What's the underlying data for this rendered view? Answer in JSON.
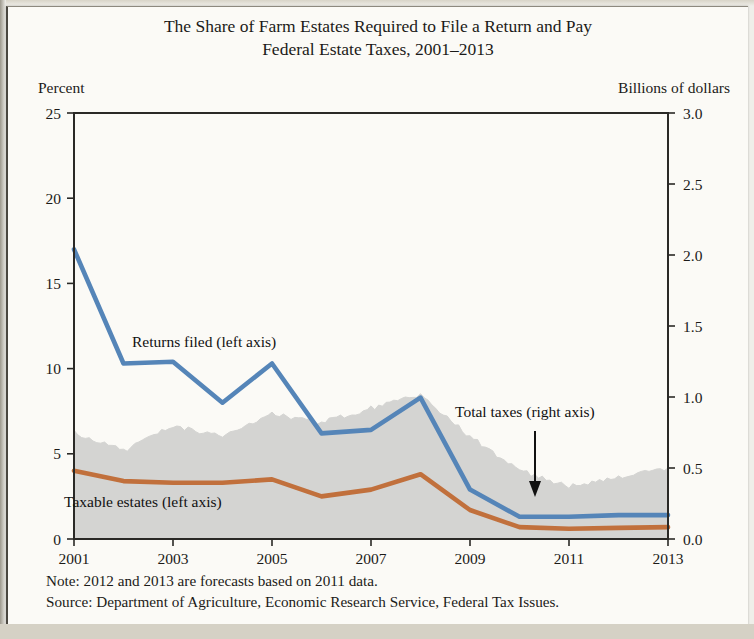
{
  "title": {
    "line1": "The Share of Farm Estates Required to File a Return and Pay",
    "line2": "Federal Estate Taxes, 2001–2013"
  },
  "axis_labels": {
    "left": "Percent",
    "right": "Billions of dollars"
  },
  "annotations": {
    "returns_filed": "Returns filed (left axis)",
    "taxable_estates": "Taxable estates (left axis)",
    "total_taxes": "Total taxes (right axis)"
  },
  "footnotes": {
    "note": "Note: 2012 and 2013 are forecasts based on 2011 data.",
    "source": "Source: Department of Agriculture, Economic Research Service, Federal Tax Issues."
  },
  "colors": {
    "returns_filed": "#5585b8",
    "taxable_estates": "#c1703c",
    "total_taxes_area": "#d4d4d2",
    "axis": "#2a2926",
    "text": "#1b1a18",
    "paper": "#fbfaf6"
  },
  "chart_data": {
    "type": "line",
    "title": "The Share of Farm Estates Required to File a Return and Pay Federal Estate Taxes, 2001–2013",
    "xlabel": "",
    "ylabel": "Percent",
    "y2label": "Billions of dollars",
    "grid": false,
    "legend": "inline-annotations",
    "x": [
      2001,
      2002,
      2003,
      2004,
      2005,
      2006,
      2007,
      2008,
      2009,
      2010,
      2011,
      2012,
      2013
    ],
    "xtick_labels": [
      "2001",
      "2003",
      "2005",
      "2007",
      "2009",
      "2011",
      "2013"
    ],
    "xtick_values": [
      2001,
      2003,
      2005,
      2007,
      2009,
      2011,
      2013
    ],
    "ylim": [
      0,
      25
    ],
    "ytick_labels": [
      "0",
      "5",
      "10",
      "15",
      "20",
      "25"
    ],
    "ytick_values": [
      0,
      5,
      10,
      15,
      20,
      25
    ],
    "y2lim": [
      0,
      3.0
    ],
    "y2tick_labels": [
      "0.0",
      "0.5",
      "1.0",
      "1.5",
      "2.0",
      "2.5",
      "3.0"
    ],
    "y2tick_values": [
      0.0,
      0.5,
      1.0,
      1.5,
      2.0,
      2.5,
      3.0
    ],
    "series": [
      {
        "name": "Returns filed (left axis)",
        "axis": "left",
        "style": "line",
        "color": "#5585b8",
        "values": [
          17.0,
          10.3,
          10.4,
          8.0,
          10.3,
          6.2,
          6.4,
          8.3,
          2.9,
          1.3,
          1.3,
          1.4,
          1.4
        ]
      },
      {
        "name": "Taxable estates (left axis)",
        "axis": "left",
        "style": "line",
        "color": "#c1703c",
        "values": [
          4.0,
          3.4,
          3.3,
          3.3,
          3.5,
          2.5,
          2.9,
          3.8,
          1.7,
          0.7,
          0.6,
          0.65,
          0.7
        ]
      },
      {
        "name": "Total taxes (right axis)",
        "axis": "right",
        "style": "area",
        "color": "#d4d4d2",
        "values": [
          0.75,
          0.62,
          0.8,
          0.72,
          0.88,
          0.82,
          0.92,
          1.02,
          0.72,
          0.48,
          0.37,
          0.43,
          0.5
        ]
      }
    ]
  }
}
